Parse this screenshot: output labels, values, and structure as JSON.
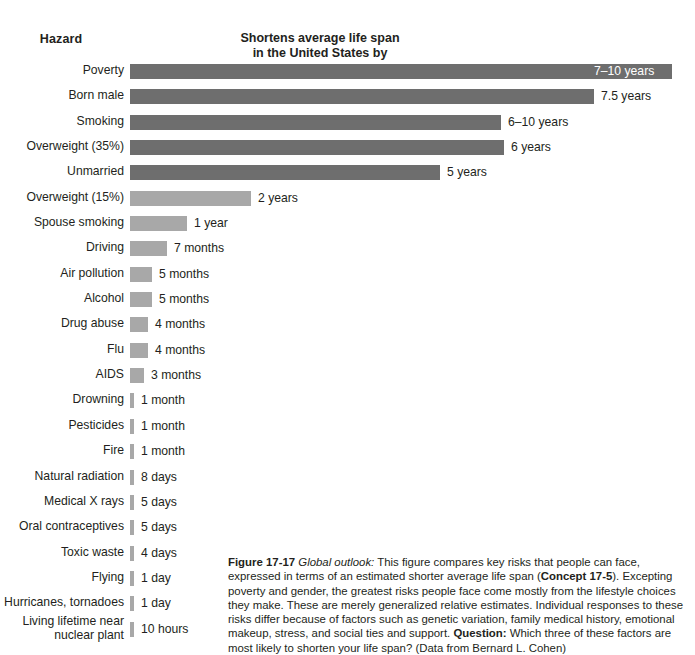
{
  "headers": {
    "hazard": "Hazard",
    "value_line1": "Shortens average life span",
    "value_line2": "in the United States by"
  },
  "chart_data": {
    "type": "bar",
    "orientation": "horizontal",
    "title": "Shortens average life span in the United States by",
    "xlabel": "",
    "ylabel": "Hazard",
    "grid": false,
    "legend": "none",
    "categories": [
      "Poverty",
      "Born male",
      "Smoking",
      "Overweight (35%)",
      "Unmarried",
      "Overweight (15%)",
      "Spouse smoking",
      "Driving",
      "Air pollution",
      "Alcohol",
      "Drug abuse",
      "Flu",
      "AIDS",
      "Drowning",
      "Pesticides",
      "Fire",
      "Natural radiation",
      "Medical X rays",
      "Oral contraceptives",
      "Toxic waste",
      "Flying",
      "Hurricanes, tornadoes",
      "Living lifetime near nuclear plant"
    ],
    "value_labels": [
      "7–10 years",
      "7.5 years",
      "6–10 years",
      "6 years",
      "5 years",
      "2 years",
      "1 year",
      "7 months",
      "5 months",
      "5 months",
      "4 months",
      "4 months",
      "3 months",
      "1 month",
      "1 month",
      "1 month",
      "8 days",
      "5 days",
      "5 days",
      "4 days",
      "1 day",
      "1 day",
      "10 hours"
    ],
    "values_years": [
      8.5,
      7.5,
      8.0,
      6.0,
      5.0,
      2.0,
      1.0,
      0.583,
      0.417,
      0.417,
      0.333,
      0.333,
      0.25,
      0.0833,
      0.0833,
      0.0833,
      0.0219,
      0.0137,
      0.0137,
      0.011,
      0.0027,
      0.0027,
      0.00114
    ],
    "bar_px": [
      542,
      464,
      371,
      374,
      310,
      121,
      57,
      37,
      22,
      22,
      18,
      18,
      14,
      4,
      4,
      4,
      4,
      4,
      4,
      4,
      4,
      4,
      4
    ],
    "colors": {
      "dark": "#6e6e6e",
      "light": "#a8a8a8",
      "label_inside": "#ffffff",
      "text": "#231f20",
      "background": "#ffffff"
    },
    "series_groups": [
      {
        "name": "Highest risks",
        "color": "#6e6e6e",
        "rows": [
          0,
          1,
          2,
          3,
          4
        ]
      },
      {
        "name": "Lower risks",
        "color": "#a8a8a8",
        "rows": [
          5,
          6,
          7,
          8,
          9,
          10,
          11,
          12,
          13,
          14,
          15,
          16,
          17,
          18,
          19,
          20,
          21,
          22
        ]
      }
    ]
  },
  "rows": [
    {
      "label": "Poverty",
      "value": "7–10 years",
      "px": 542,
      "shade": "dark",
      "inside": true
    },
    {
      "label": "Born male",
      "value": "7.5 years",
      "px": 464,
      "shade": "dark",
      "inside": false
    },
    {
      "label": "Smoking",
      "value": "6–10 years",
      "px": 371,
      "shade": "dark",
      "inside": false
    },
    {
      "label": "Overweight (35%)",
      "value": "6 years",
      "px": 374,
      "shade": "dark",
      "inside": false
    },
    {
      "label": "Unmarried",
      "value": "5 years",
      "px": 310,
      "shade": "dark",
      "inside": false
    },
    {
      "label": "Overweight (15%)",
      "value": "2 years",
      "px": 121,
      "shade": "light",
      "inside": false
    },
    {
      "label": "Spouse smoking",
      "value": "1 year",
      "px": 57,
      "shade": "light",
      "inside": false
    },
    {
      "label": "Driving",
      "value": "7 months",
      "px": 37,
      "shade": "light",
      "inside": false
    },
    {
      "label": "Air pollution",
      "value": "5 months",
      "px": 22,
      "shade": "light",
      "inside": false
    },
    {
      "label": "Alcohol",
      "value": "5 months",
      "px": 22,
      "shade": "light",
      "inside": false
    },
    {
      "label": "Drug abuse",
      "value": "4 months",
      "px": 18,
      "shade": "light",
      "inside": false
    },
    {
      "label": "Flu",
      "value": "4 months",
      "px": 18,
      "shade": "light",
      "inside": false
    },
    {
      "label": "AIDS",
      "value": "3 months",
      "px": 14,
      "shade": "light",
      "inside": false
    },
    {
      "label": "Drowning",
      "value": "1 month",
      "px": 4,
      "shade": "light",
      "inside": false
    },
    {
      "label": "Pesticides",
      "value": "1 month",
      "px": 4,
      "shade": "light",
      "inside": false
    },
    {
      "label": "Fire",
      "value": "1 month",
      "px": 4,
      "shade": "light",
      "inside": false
    },
    {
      "label": "Natural radiation",
      "value": "8 days",
      "px": 4,
      "shade": "light",
      "inside": false
    },
    {
      "label": "Medical X rays",
      "value": "5 days",
      "px": 4,
      "shade": "light",
      "inside": false
    },
    {
      "label": "Oral contraceptives",
      "value": "5 days",
      "px": 4,
      "shade": "light",
      "inside": false
    },
    {
      "label": "Toxic waste",
      "value": "4 days",
      "px": 4,
      "shade": "light",
      "inside": false
    },
    {
      "label": "Flying",
      "value": "1 day",
      "px": 4,
      "shade": "light",
      "inside": false
    },
    {
      "label": "Hurricanes, tornadoes",
      "value": "1 day",
      "px": 4,
      "shade": "light",
      "inside": false
    },
    {
      "label": "Living lifetime near\nnuclear plant",
      "value": "10 hours",
      "px": 4,
      "shade": "light",
      "inside": false,
      "two_line": true
    }
  ],
  "caption": {
    "figure_number": "Figure 17-17",
    "lead_italic": "Global outlook:",
    "text_1": " This figure compares key risks that people can face, expressed in terms of an estimated shorter average life span (",
    "concept": "Concept 17-5",
    "text_2": "). Excepting poverty and gender, the greatest risks people face come mostly from the lifestyle choices they make. These are merely generalized relative estimates. Individual responses to these risks differ because of factors such as genetic variation, family medical history, emotional makeup, stress, and social ties and support. ",
    "question_label": "Question:",
    "text_3": " Which three of these factors are most likely to shorten your life span? (Data from Bernard L. Cohen)"
  }
}
